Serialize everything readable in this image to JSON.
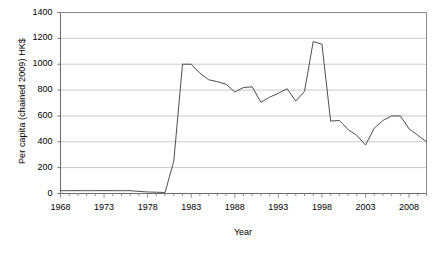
{
  "chart_data": {
    "type": "line",
    "title": "",
    "xlabel": "Year",
    "ylabel": "Per capita (chained 2009) HK$",
    "xlim": [
      1968,
      2010
    ],
    "ylim": [
      0,
      1400
    ],
    "ytick_values": [
      0,
      200,
      400,
      600,
      800,
      1000,
      1200,
      1400
    ],
    "ytick_labels": [
      "0",
      "200",
      "400",
      "600",
      "800",
      "1000",
      "1200",
      "1400"
    ],
    "xtick_values": [
      1968,
      1973,
      1978,
      1983,
      1988,
      1993,
      1998,
      2003,
      2008
    ],
    "xtick_labels": [
      "1968",
      "1973",
      "1978",
      "1983",
      "1988",
      "1993",
      "1998",
      "2003",
      "2008"
    ],
    "grid": "horizontal",
    "legend": "none",
    "line_color": "#4d4d4d",
    "series": [
      {
        "name": "Per capita (chained 2009) HK$",
        "x": [
          1968,
          1969,
          1970,
          1971,
          1972,
          1973,
          1974,
          1975,
          1976,
          1977,
          1978,
          1979,
          1980,
          1981,
          1982,
          1983,
          1984,
          1985,
          1986,
          1987,
          1988,
          1989,
          1990,
          1991,
          1992,
          1993,
          1994,
          1995,
          1996,
          1997,
          1998,
          1999,
          2000,
          2001,
          2002,
          2003,
          2004,
          2005,
          2006,
          2007,
          2008,
          2009,
          2010
        ],
        "values": [
          22,
          22,
          22,
          22,
          22,
          22,
          22,
          22,
          22,
          16,
          12,
          10,
          8,
          250,
          1000,
          1000,
          930,
          880,
          865,
          845,
          785,
          820,
          825,
          705,
          745,
          775,
          810,
          715,
          790,
          1175,
          1155,
          560,
          565,
          495,
          450,
          375,
          505,
          565,
          600,
          600,
          500,
          450,
          400
        ]
      }
    ],
    "annotations": []
  },
  "axis_titles": {
    "y": "Per capita (chained 2009) HK$",
    "x": "Year"
  }
}
